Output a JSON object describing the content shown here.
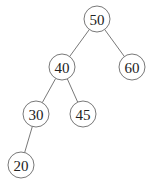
{
  "tree": {
    "nodes": [
      {
        "id": "n50",
        "label": "50",
        "cx": 97,
        "cy": 19
      },
      {
        "id": "n40",
        "label": "40",
        "cx": 62,
        "cy": 67
      },
      {
        "id": "n60",
        "label": "60",
        "cx": 132,
        "cy": 67
      },
      {
        "id": "n30",
        "label": "30",
        "cx": 36,
        "cy": 114
      },
      {
        "id": "n45",
        "label": "45",
        "cx": 83,
        "cy": 114
      },
      {
        "id": "n20",
        "label": "20",
        "cx": 21,
        "cy": 165
      }
    ],
    "edges": [
      [
        "n50",
        "n40"
      ],
      [
        "n50",
        "n60"
      ],
      [
        "n40",
        "n30"
      ],
      [
        "n40",
        "n45"
      ],
      [
        "n30",
        "n20"
      ]
    ],
    "radius": 13
  }
}
